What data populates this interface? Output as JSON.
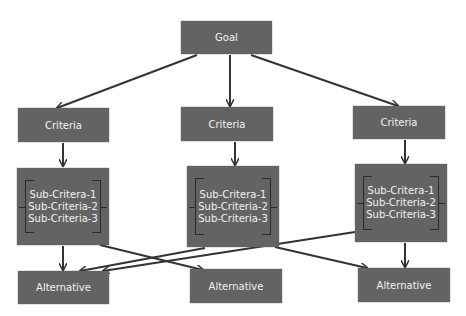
{
  "goal": {
    "label": "Goal"
  },
  "criteria": [
    {
      "label": "Criteria"
    },
    {
      "label": "Criteria"
    },
    {
      "label": "Criteria"
    }
  ],
  "subcriteria": [
    {
      "items": [
        "Sub-Critera-1",
        "Sub-Criteria-2",
        "Sub-Criteria-3"
      ]
    },
    {
      "items": [
        "Sub-Critera-1",
        "Sub-Criteria-2",
        "Sub-Criteria-3"
      ]
    },
    {
      "items": [
        "Sub-Critera-1",
        "Sub-Criteria-2",
        "Sub-Criteria-3"
      ]
    }
  ],
  "alternatives": [
    {
      "label": "Alternative"
    },
    {
      "label": "Alternative"
    },
    {
      "label": "Alternative"
    }
  ],
  "colors": {
    "box": "#636363",
    "text": "#f2f2f2",
    "arrow": "#333333"
  }
}
